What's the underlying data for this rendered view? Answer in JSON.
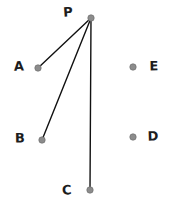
{
  "figure": {
    "title": "",
    "background_color": "#ffffff",
    "width": 172,
    "height": 210
  },
  "style": {
    "dot_fill": "#8c8c8c",
    "dot_stroke": "#707070",
    "dot_radius": 3.2,
    "segment_color": "#111111",
    "segment_width": 1.4,
    "label_color": "#1d1d1d"
  },
  "points": [
    {
      "id": "P",
      "label": "P",
      "x": 91,
      "y": 18,
      "label_x": 68,
      "label_y": 12
    },
    {
      "id": "A",
      "label": "A",
      "x": 38,
      "y": 68,
      "label_x": 19,
      "label_y": 66
    },
    {
      "id": "B",
      "label": "B",
      "x": 42,
      "y": 140,
      "label_x": 20,
      "label_y": 138
    },
    {
      "id": "C",
      "label": "C",
      "x": 90,
      "y": 190,
      "label_x": 67,
      "label_y": 190
    },
    {
      "id": "D",
      "label": "D",
      "x": 133,
      "y": 137,
      "label_x": 153,
      "label_y": 136
    },
    {
      "id": "E",
      "label": "E",
      "x": 133,
      "y": 67,
      "label_x": 154,
      "label_y": 66
    }
  ],
  "segments": [
    {
      "id": "PA",
      "from": "P",
      "to": "A"
    },
    {
      "id": "PB",
      "from": "P",
      "to": "B"
    },
    {
      "id": "PC",
      "from": "P",
      "to": "C"
    }
  ]
}
